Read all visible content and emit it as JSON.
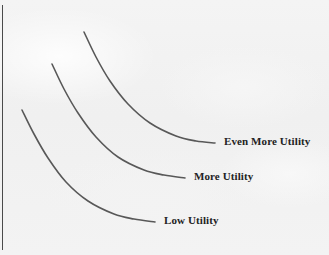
{
  "figure": {
    "background_color": "#f2f2f2",
    "border_color": "#4a4a4a",
    "curve_color": "#585858",
    "label_color": "#232323"
  },
  "chart_data": {
    "type": "line",
    "title": "",
    "subtitle": "",
    "xlabel": "",
    "ylabel": "",
    "grid": false,
    "legend_position": "inline-right-of-curve-end",
    "axis_ranges": {
      "xlim": [
        0,
        329
      ],
      "ylim": [
        255,
        0
      ]
    },
    "annotations": [
      "Low Utility",
      "More Utility",
      "Even More Utility"
    ],
    "series": [
      {
        "name": "Low Utility",
        "label": "Low Utility",
        "color": "#585858",
        "label_x": 164,
        "label_y": 214,
        "points": [
          {
            "x": 22,
            "y": 110
          },
          {
            "x": 34,
            "y": 134
          },
          {
            "x": 48,
            "y": 158
          },
          {
            "x": 66,
            "y": 182
          },
          {
            "x": 88,
            "y": 201
          },
          {
            "x": 114,
            "y": 214
          },
          {
            "x": 134,
            "y": 219
          },
          {
            "x": 155,
            "y": 222
          }
        ]
      },
      {
        "name": "More Utility",
        "label": "More Utility",
        "color": "#585858",
        "label_x": 194,
        "label_y": 170,
        "points": [
          {
            "x": 52,
            "y": 64
          },
          {
            "x": 64,
            "y": 89
          },
          {
            "x": 78,
            "y": 113
          },
          {
            "x": 96,
            "y": 137
          },
          {
            "x": 118,
            "y": 157
          },
          {
            "x": 144,
            "y": 170
          },
          {
            "x": 164,
            "y": 175
          },
          {
            "x": 185,
            "y": 178
          }
        ]
      },
      {
        "name": "Even More Utility",
        "label": "Even More Utility",
        "color": "#585858",
        "label_x": 224,
        "label_y": 135,
        "points": [
          {
            "x": 84,
            "y": 32
          },
          {
            "x": 96,
            "y": 57
          },
          {
            "x": 110,
            "y": 81
          },
          {
            "x": 128,
            "y": 104
          },
          {
            "x": 150,
            "y": 123
          },
          {
            "x": 176,
            "y": 136
          },
          {
            "x": 196,
            "y": 141
          },
          {
            "x": 215,
            "y": 143
          }
        ]
      }
    ]
  }
}
